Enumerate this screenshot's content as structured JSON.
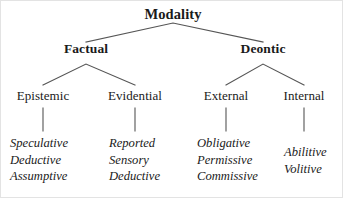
{
  "diagram": {
    "line_color": "#555555",
    "text_color": "#1a1a1a",
    "background": "#ffffff",
    "root": {
      "label": "Modality"
    },
    "branches": [
      {
        "label": "Factual",
        "children": [
          {
            "label": "Epistemic",
            "leaves": [
              "Speculative",
              "Deductive",
              "Assumptive"
            ]
          },
          {
            "label": "Evidential",
            "leaves": [
              "Reported",
              "Sensory",
              "Deductive"
            ]
          }
        ]
      },
      {
        "label": "Deontic",
        "children": [
          {
            "label": "External",
            "leaves": [
              "Obligative",
              "Permissive",
              "Commissive"
            ]
          },
          {
            "label": "Internal",
            "leaves": [
              "Abilitive",
              "Volitive"
            ]
          }
        ]
      }
    ]
  }
}
